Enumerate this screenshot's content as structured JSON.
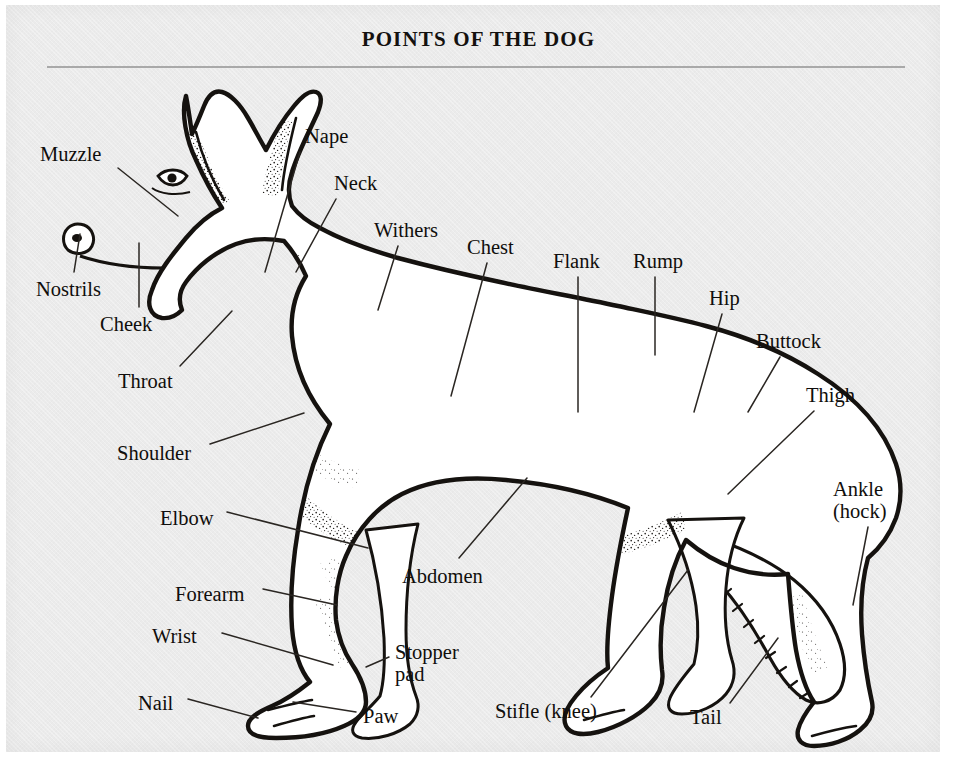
{
  "title": "POINTS OF THE DOG",
  "colors": {
    "paper": "#ebebeb",
    "ink": "#100e0c",
    "rule": "#a9a9a9",
    "page_margin": "#ffffff"
  },
  "labels": [
    {
      "key": "muzzle",
      "text": "Muzzle",
      "x": 40,
      "y": 143,
      "line": [
        118,
        168,
        178,
        216
      ]
    },
    {
      "key": "nape",
      "text": "Nape",
      "x": 305,
      "y": 125,
      "line": [
        300,
        152,
        265,
        272
      ]
    },
    {
      "key": "neck",
      "text": "Neck",
      "x": 334,
      "y": 172,
      "line": [
        336,
        199,
        296,
        272
      ]
    },
    {
      "key": "withers",
      "text": "Withers",
      "x": 374,
      "y": 219,
      "line": [
        398,
        246,
        378,
        310
      ]
    },
    {
      "key": "chest",
      "text": "Chest",
      "x": 467,
      "y": 236,
      "line": [
        487,
        263,
        451,
        396
      ]
    },
    {
      "key": "flank",
      "text": "Flank",
      "x": 553,
      "y": 250,
      "line": [
        578,
        277,
        578,
        412
      ]
    },
    {
      "key": "rump",
      "text": "Rump",
      "x": 633,
      "y": 250,
      "line": [
        655,
        277,
        655,
        355
      ]
    },
    {
      "key": "hip",
      "text": "Hip",
      "x": 709,
      "y": 287,
      "line": [
        722,
        314,
        694,
        412
      ]
    },
    {
      "key": "buttock",
      "text": "Buttock",
      "x": 756,
      "y": 330,
      "line": [
        780,
        357,
        748,
        412
      ]
    },
    {
      "key": "thigh",
      "text": "Thigh",
      "x": 806,
      "y": 384,
      "line": [
        814,
        411,
        728,
        494
      ]
    },
    {
      "key": "ankle_hock",
      "text": "Ankle\n(hock)",
      "x": 833,
      "y": 478,
      "line": [
        868,
        527,
        853,
        605
      ]
    },
    {
      "key": "nostrils",
      "text": "Nostrils",
      "x": 36,
      "y": 278,
      "line": [
        74,
        272,
        80,
        234
      ]
    },
    {
      "key": "cheek",
      "text": "Cheek",
      "x": 100,
      "y": 313,
      "line": [
        139,
        307,
        139,
        243
      ]
    },
    {
      "key": "throat",
      "text": "Throat",
      "x": 118,
      "y": 370,
      "line": [
        180,
        366,
        232,
        311
      ]
    },
    {
      "key": "shoulder",
      "text": "Shoulder",
      "x": 117,
      "y": 442,
      "line": [
        210,
        444,
        304,
        413
      ]
    },
    {
      "key": "elbow",
      "text": "Elbow",
      "x": 160,
      "y": 507,
      "line": [
        227,
        512,
        368,
        548
      ]
    },
    {
      "key": "forearm",
      "text": "Forearm",
      "x": 175,
      "y": 583,
      "line": [
        263,
        589,
        337,
        605
      ]
    },
    {
      "key": "wrist",
      "text": "Wrist",
      "x": 152,
      "y": 625,
      "line": [
        222,
        633,
        333,
        665
      ]
    },
    {
      "key": "nail",
      "text": "Nail",
      "x": 138,
      "y": 692,
      "line": [
        188,
        699,
        258,
        718
      ]
    },
    {
      "key": "abdomen",
      "text": "Abdomen",
      "x": 402,
      "y": 565,
      "line": [
        459,
        558,
        527,
        478
      ]
    },
    {
      "key": "stopper_pad",
      "text": "Stopper\npad",
      "x": 395,
      "y": 641,
      "line": [
        389,
        657,
        366,
        667
      ]
    },
    {
      "key": "paw",
      "text": "Paw",
      "x": 363,
      "y": 705,
      "line": [
        356,
        712,
        293,
        702
      ]
    },
    {
      "key": "stifle_knee",
      "text": "Stifle (knee)",
      "x": 495,
      "y": 700,
      "line": [
        591,
        697,
        688,
        570
      ]
    },
    {
      "key": "tail",
      "text": "Tail",
      "x": 690,
      "y": 706,
      "line": [
        730,
        703,
        778,
        638
      ]
    }
  ]
}
